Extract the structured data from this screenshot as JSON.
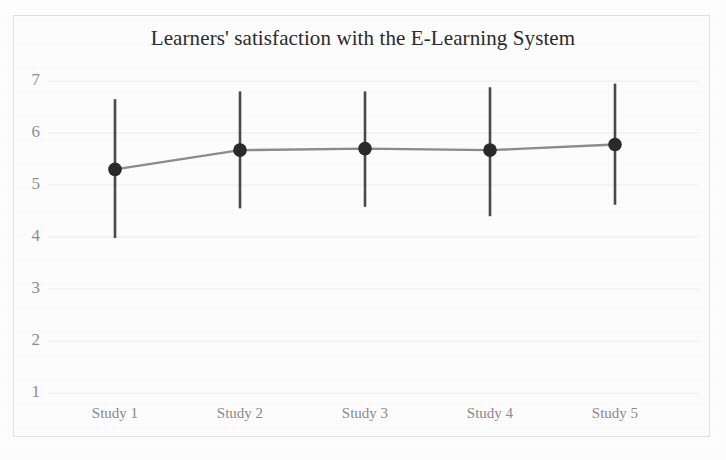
{
  "chart_data": {
    "type": "line",
    "title": "Learners' satisfaction with the E-Learning System",
    "xlabel": "",
    "ylabel": "",
    "categories": [
      "Study 1",
      "Study 2",
      "Study 3",
      "Study 4",
      "Study 5"
    ],
    "values": [
      5.3,
      5.67,
      5.7,
      5.67,
      5.78
    ],
    "error_bars": {
      "lower": [
        3.98,
        4.55,
        4.58,
        4.4,
        4.62
      ],
      "upper": [
        6.65,
        6.8,
        6.8,
        6.88,
        6.95
      ]
    },
    "series": [
      {
        "name": "Mean satisfaction",
        "values": [
          5.3,
          5.67,
          5.7,
          5.67,
          5.78
        ]
      }
    ],
    "ylim": [
      1,
      7
    ],
    "yticks": [
      1,
      2,
      3,
      4,
      5,
      6,
      7
    ],
    "ytick_labels": [
      "1",
      "2",
      "3",
      "4",
      "5",
      "6",
      "7"
    ],
    "grid": true,
    "grid_axis": "y",
    "legend": false,
    "legend_position": "none",
    "marker": "filled-circle",
    "colors": {
      "marker": "#2a2a2a",
      "error_bar": "#4a4a4a",
      "line": "#8c8c8c",
      "grid": "#ececec",
      "tick_text": "#8e8e8e",
      "title_text": "#2b2b2b",
      "background": "#fdfdfd",
      "border": "#e2e2e2"
    }
  }
}
